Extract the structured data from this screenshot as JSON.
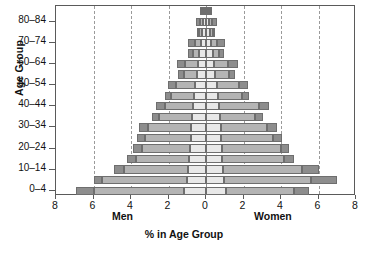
{
  "chart_data": {
    "type": "bar",
    "subtype": "population-pyramid",
    "title": "",
    "xlabel": "% in Age Group",
    "ylabel": "Age Group",
    "grid": true,
    "legend": "none",
    "xlim": [
      -8,
      8
    ],
    "xtick_labels": [
      "8",
      "6",
      "4",
      "2",
      "0",
      "2",
      "4",
      "6",
      "8"
    ],
    "xtick_values": [
      -8,
      -6,
      -4,
      -2,
      0,
      2,
      4,
      6,
      8
    ],
    "side_labels": {
      "left": "Men",
      "right": "Women"
    },
    "categories": [
      "0-4",
      "5-9",
      "10-14",
      "15-19",
      "20-24",
      "25-29",
      "30-34",
      "35-39",
      "40-44",
      "45-49",
      "50-54",
      "55-59",
      "60-64",
      "65-69",
      "70-74",
      "75-79",
      "80-84",
      "85+"
    ],
    "ytick_labels": [
      "0-4",
      "10-14",
      "20-24",
      "30-34",
      "40-44",
      "50-54",
      "60-64",
      "70-74",
      "80-84"
    ],
    "segment_names": [
      "inner",
      "middle",
      "outer"
    ],
    "colors": {
      "inner": "#e8e8e8",
      "middle": "#b4b4b4",
      "outer": "#8d8d8d",
      "border": "#6e6e6e",
      "grid": "#9a9a9a",
      "frame": "#5a5a5a"
    },
    "series": [
      {
        "name": "Men",
        "side": "left",
        "stacks": [
          {
            "category": "0-4",
            "inner": 1.15,
            "middle": 4.85,
            "outer": 0.95,
            "total": 6.95
          },
          {
            "category": "5-9",
            "inner": 1.0,
            "middle": 4.55,
            "outer": 0.45,
            "total": 6.0
          },
          {
            "category": "10-14",
            "inner": 0.95,
            "middle": 3.4,
            "outer": 0.55,
            "total": 4.9
          },
          {
            "category": "15-19",
            "inner": 0.9,
            "middle": 2.85,
            "outer": 0.45,
            "total": 4.2
          },
          {
            "category": "20-24",
            "inner": 0.85,
            "middle": 2.55,
            "outer": 0.5,
            "total": 3.9
          },
          {
            "category": "25-29",
            "inner": 0.8,
            "middle": 2.45,
            "outer": 0.45,
            "total": 3.7
          },
          {
            "category": "30-34",
            "inner": 0.8,
            "middle": 2.3,
            "outer": 0.5,
            "total": 3.6
          },
          {
            "category": "35-39",
            "inner": 0.75,
            "middle": 1.75,
            "outer": 0.4,
            "total": 2.9
          },
          {
            "category": "40-44",
            "inner": 0.7,
            "middle": 1.5,
            "outer": 0.45,
            "total": 2.65
          },
          {
            "category": "45-49",
            "inner": 0.65,
            "middle": 1.2,
            "outer": 0.35,
            "total": 2.2
          },
          {
            "category": "50-54",
            "inner": 0.6,
            "middle": 1.0,
            "outer": 0.45,
            "total": 2.05
          },
          {
            "category": "55-59",
            "inner": 0.5,
            "middle": 0.7,
            "outer": 0.3,
            "total": 1.5
          },
          {
            "category": "60-64",
            "inner": 0.45,
            "middle": 0.65,
            "outer": 0.45,
            "total": 1.55
          },
          {
            "category": "65-69",
            "inner": 0.35,
            "middle": 0.35,
            "outer": 0.25,
            "total": 0.95
          },
          {
            "category": "70-74",
            "inner": 0.28,
            "middle": 0.32,
            "outer": 0.35,
            "total": 0.95
          },
          {
            "category": "75-79",
            "inner": 0.2,
            "middle": 0.18,
            "outer": 0.12,
            "total": 0.5
          },
          {
            "category": "80-84",
            "inner": 0.15,
            "middle": 0.15,
            "outer": 0.25,
            "total": 0.55
          },
          {
            "category": "85+",
            "inner": 0.1,
            "middle": 0.1,
            "outer": 0.12,
            "total": 0.32
          }
        ]
      },
      {
        "name": "Women",
        "side": "right",
        "stacks": [
          {
            "category": "0-4",
            "inner": 1.05,
            "middle": 3.65,
            "outer": 0.8,
            "total": 5.5
          },
          {
            "category": "5-9",
            "inner": 0.95,
            "middle": 4.65,
            "outer": 1.4,
            "total": 7.0
          },
          {
            "category": "10-14",
            "inner": 0.9,
            "middle": 4.2,
            "outer": 0.95,
            "total": 6.05
          },
          {
            "category": "15-19",
            "inner": 0.85,
            "middle": 3.3,
            "outer": 0.55,
            "total": 4.7
          },
          {
            "category": "20-24",
            "inner": 0.85,
            "middle": 3.15,
            "outer": 0.45,
            "total": 4.45
          },
          {
            "category": "25-29",
            "inner": 0.8,
            "middle": 2.75,
            "outer": 0.5,
            "total": 4.05
          },
          {
            "category": "30-34",
            "inner": 0.8,
            "middle": 2.45,
            "outer": 0.55,
            "total": 3.8
          },
          {
            "category": "35-39",
            "inner": 0.75,
            "middle": 1.85,
            "outer": 0.45,
            "total": 3.05
          },
          {
            "category": "40-44",
            "inner": 0.7,
            "middle": 2.1,
            "outer": 0.55,
            "total": 3.35
          },
          {
            "category": "45-49",
            "inner": 0.65,
            "middle": 1.25,
            "outer": 0.4,
            "total": 2.3
          },
          {
            "category": "50-54",
            "inner": 0.6,
            "middle": 1.15,
            "outer": 0.5,
            "total": 2.25
          },
          {
            "category": "55-59",
            "inner": 0.5,
            "middle": 0.75,
            "outer": 0.3,
            "total": 1.55
          },
          {
            "category": "60-64",
            "inner": 0.45,
            "middle": 0.7,
            "outer": 0.55,
            "total": 1.7
          },
          {
            "category": "65-69",
            "inner": 0.35,
            "middle": 0.35,
            "outer": 0.25,
            "total": 0.95
          },
          {
            "category": "70-74",
            "inner": 0.28,
            "middle": 0.32,
            "outer": 0.4,
            "total": 1.0
          },
          {
            "category": "75-79",
            "inner": 0.2,
            "middle": 0.18,
            "outer": 0.12,
            "total": 0.5
          },
          {
            "category": "80-84",
            "inner": 0.15,
            "middle": 0.15,
            "outer": 0.28,
            "total": 0.58
          },
          {
            "category": "85+",
            "inner": 0.1,
            "middle": 0.1,
            "outer": 0.12,
            "total": 0.32
          }
        ]
      }
    ]
  }
}
